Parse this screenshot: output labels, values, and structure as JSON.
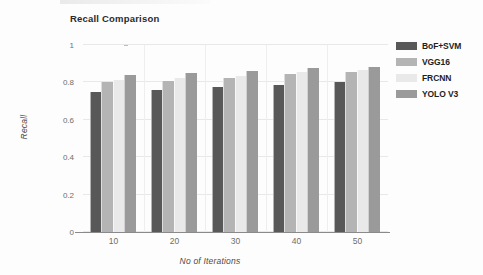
{
  "chart_data": {
    "type": "bar",
    "title": "Recall Comparison",
    "xlabel": "No of Iterations",
    "ylabel": "Recall",
    "categories": [
      "10",
      "20",
      "30",
      "40",
      "50"
    ],
    "series": [
      {
        "name": "BoF+SVM",
        "color": "#585858",
        "values": [
          0.75,
          0.76,
          0.775,
          0.785,
          0.8
        ]
      },
      {
        "name": "VGG16",
        "color": "#b4b4b4",
        "values": [
          0.8,
          0.81,
          0.825,
          0.845,
          0.855
        ]
      },
      {
        "name": "FRCNN",
        "color": "#e9e9e9",
        "values": [
          0.815,
          0.825,
          0.835,
          0.855,
          0.865
        ]
      },
      {
        "name": "YOLO V3",
        "color": "#9a9a9a",
        "values": [
          0.84,
          0.85,
          0.86,
          0.875,
          0.885
        ]
      }
    ],
    "ylim": [
      0,
      1
    ],
    "yticks": [
      0,
      0.2,
      0.4,
      0.6,
      0.8,
      1
    ],
    "yticklabels": [
      "0",
      "0.2",
      "0.4",
      "0.6",
      "0.8",
      "1"
    ],
    "grid": true,
    "legend_position": "right"
  },
  "legend": {
    "entries": [
      {
        "label": "BoF+SVM",
        "color": "#585858"
      },
      {
        "label": "VGG16",
        "color": "#b4b4b4"
      },
      {
        "label": "FRCNN",
        "color": "#e9e9e9"
      },
      {
        "label": "YOLO V3",
        "color": "#9a9a9a"
      }
    ]
  }
}
